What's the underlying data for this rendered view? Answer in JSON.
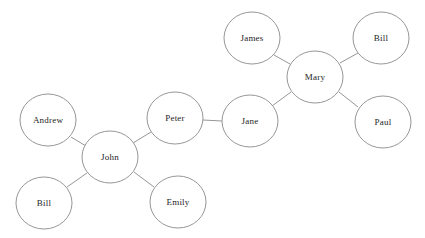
{
  "chart_data": {
    "type": "diagram",
    "subtype": "node-link-network-graph",
    "title": "",
    "background_color": "#ffffff",
    "node_fill": "#ffffff",
    "node_stroke": "#8a8a8a",
    "edge_color": "#8a8a8a",
    "label_color": "#1d1d1d",
    "node_radius_x": 28,
    "node_radius_y": 26,
    "canvas": {
      "width": 425,
      "height": 238
    },
    "nodes": [
      {
        "id": "james",
        "label": "James",
        "cx": 252,
        "cy": 38,
        "rx": 28,
        "ry": 26
      },
      {
        "id": "bill_a",
        "label": "Bill",
        "cx": 381,
        "cy": 38,
        "rx": 28,
        "ry": 26
      },
      {
        "id": "mary",
        "label": "Mary",
        "cx": 315,
        "cy": 77,
        "rx": 28,
        "ry": 26
      },
      {
        "id": "jane",
        "label": "Jane",
        "cx": 250,
        "cy": 121,
        "rx": 28,
        "ry": 26
      },
      {
        "id": "paul",
        "label": "Paul",
        "cx": 383,
        "cy": 122,
        "rx": 28,
        "ry": 26
      },
      {
        "id": "peter",
        "label": "Peter",
        "cx": 175,
        "cy": 118,
        "rx": 28,
        "ry": 26
      },
      {
        "id": "andrew",
        "label": "Andrew",
        "cx": 48,
        "cy": 120,
        "rx": 28,
        "ry": 26
      },
      {
        "id": "john",
        "label": "John",
        "cx": 110,
        "cy": 157,
        "rx": 28,
        "ry": 26
      },
      {
        "id": "bill_b",
        "label": "Bill",
        "cx": 44,
        "cy": 203,
        "rx": 28,
        "ry": 26
      },
      {
        "id": "emily",
        "label": "Emily",
        "cx": 178,
        "cy": 202,
        "rx": 28,
        "ry": 26
      }
    ],
    "edges": [
      {
        "source": "mary",
        "target": "james",
        "x1": 290,
        "y1": 64,
        "x2": 274,
        "y2": 55
      },
      {
        "source": "mary",
        "target": "bill_a",
        "x1": 340,
        "y1": 63,
        "x2": 358,
        "y2": 53
      },
      {
        "source": "mary",
        "target": "paul",
        "x1": 339,
        "y1": 92,
        "x2": 358,
        "y2": 107
      },
      {
        "source": "mary",
        "target": "jane",
        "x1": 291,
        "y1": 92,
        "x2": 272,
        "y2": 106
      },
      {
        "source": "jane",
        "target": "peter",
        "x1": 222,
        "y1": 121,
        "x2": 203,
        "y2": 120
      },
      {
        "source": "peter",
        "target": "john",
        "x1": 151,
        "y1": 132,
        "x2": 133,
        "y2": 143
      },
      {
        "source": "john",
        "target": "andrew",
        "x1": 86,
        "y1": 146,
        "x2": 71,
        "y2": 137
      },
      {
        "source": "john",
        "target": "bill_b",
        "x1": 87,
        "y1": 173,
        "x2": 67,
        "y2": 187
      },
      {
        "source": "john",
        "target": "emily",
        "x1": 134,
        "y1": 172,
        "x2": 154,
        "y2": 187
      }
    ]
  }
}
